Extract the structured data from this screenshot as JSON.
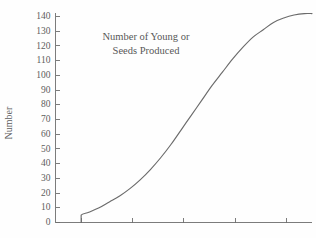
{
  "chart_data": {
    "type": "line",
    "title": "Number of Young or Seeds Produced",
    "title_line1": "Number of Young or",
    "title_line2": "Seeds Produced",
    "xlabel": "",
    "ylabel": "Number",
    "ylim": [
      0,
      145
    ],
    "xlim": [
      0,
      10
    ],
    "grid": false,
    "legend": false,
    "curve_color": "#6b6b6b",
    "axis_color": "#6e6e6e",
    "text_color": "#5a5a5a",
    "ytick_labels": [
      "0",
      "10",
      "20",
      "30",
      "40",
      "50",
      "60",
      "70",
      "80",
      "90",
      "100",
      "110",
      "120",
      "130",
      "140"
    ],
    "ytick_values": [
      0,
      10,
      20,
      30,
      40,
      50,
      60,
      70,
      80,
      90,
      100,
      110,
      120,
      130,
      140
    ],
    "xtick_labels": [
      "",
      "",
      "",
      "",
      ""
    ],
    "xtick_values": [
      1,
      3,
      5,
      7,
      9
    ],
    "series": [
      {
        "name": "Sigmoid growth",
        "x": [
          1.0,
          1.0,
          1.3,
          1.7,
          2.1,
          2.5,
          2.9,
          3.3,
          3.7,
          4.1,
          4.5,
          4.9,
          5.3,
          5.7,
          6.1,
          6.5,
          6.9,
          7.3,
          7.7,
          8.1,
          8.5,
          8.9,
          9.3,
          9.7,
          10.0
        ],
        "values": [
          0,
          5,
          7,
          10,
          14,
          18,
          23,
          29,
          36,
          44,
          53,
          63,
          73,
          83,
          93,
          102,
          111,
          119,
          126,
          131,
          136,
          139,
          141,
          142,
          142
        ]
      }
    ]
  }
}
